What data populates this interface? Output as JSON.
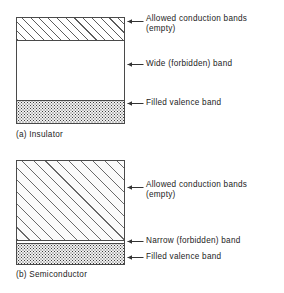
{
  "figure": {
    "accent_color": "#4a4a4a",
    "background_color": "#ffffff"
  },
  "diagrams": [
    {
      "id": "insulator",
      "caption": "(a) Insulator",
      "segments": [
        {
          "name": "conduction-band",
          "fill": "hatch",
          "label": "Allowed conduction bands\n(empty)"
        },
        {
          "name": "forbidden-gap",
          "fill": "blank",
          "label": "Wide (forbidden) band"
        },
        {
          "name": "valence-band",
          "fill": "stipple",
          "label": "Filled valence band"
        }
      ]
    },
    {
      "id": "semiconductor",
      "caption": "(b) Semiconductor",
      "segments": [
        {
          "name": "conduction-band",
          "fill": "hatch",
          "label": "Allowed conduction bands\n(empty)"
        },
        {
          "name": "forbidden-gap",
          "fill": "rule",
          "label": "Narrow (forbidden) band"
        },
        {
          "name": "valence-band",
          "fill": "stipple",
          "label": "Filled valence band"
        }
      ]
    }
  ],
  "labels": {
    "a_conduction": "Allowed conduction bands\n(empty)",
    "a_forbidden": "Wide (forbidden) band",
    "a_valence": "Filled valence band",
    "a_caption": "(a) Insulator",
    "b_conduction": "Allowed conduction bands\n(empty)",
    "b_forbidden": "Narrow (forbidden) band",
    "b_valence": "Filled valence band",
    "b_caption": "(b) Semiconductor"
  }
}
